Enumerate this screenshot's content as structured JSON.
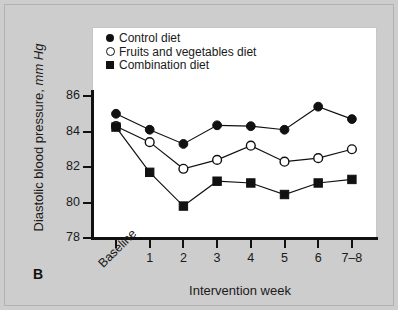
{
  "panel": {
    "label": "B"
  },
  "chart_data": {
    "type": "line",
    "title": "",
    "xlabel": "Intervention week",
    "ylabel": "Diastolic blood pressure, mm Hg",
    "ylabel_main": "Diastolic blood pressure,",
    "ylabel_unit": "mm Hg",
    "categories": [
      "Baseline",
      "1",
      "2",
      "3",
      "4",
      "5",
      "6",
      "7–8"
    ],
    "ylim": [
      78,
      86.8
    ],
    "yticks": [
      78,
      80,
      82,
      84,
      86
    ],
    "ytick_labels": [
      "78",
      "80",
      "82",
      "84",
      "86"
    ],
    "grid": false,
    "legend_position": "top-left",
    "series": [
      {
        "name": "Control diet",
        "marker": "filled-circle",
        "values": [
          85.0,
          84.1,
          83.3,
          84.35,
          84.3,
          84.1,
          85.4,
          84.7
        ]
      },
      {
        "name": "Fruits and vegetables diet",
        "marker": "open-circle",
        "values": [
          84.3,
          83.4,
          81.9,
          82.4,
          83.2,
          82.3,
          82.5,
          83.0
        ]
      },
      {
        "name": "Combination diet",
        "marker": "filled-square",
        "values": [
          84.25,
          81.7,
          79.8,
          81.2,
          81.1,
          80.45,
          81.1,
          81.3
        ]
      }
    ],
    "colors": {
      "line": "#111111",
      "marker_fill": "#111111",
      "marker_open_fill": "#ffffff",
      "plot_background": "#ffffff",
      "figure_background": "#cdcdcd"
    }
  }
}
